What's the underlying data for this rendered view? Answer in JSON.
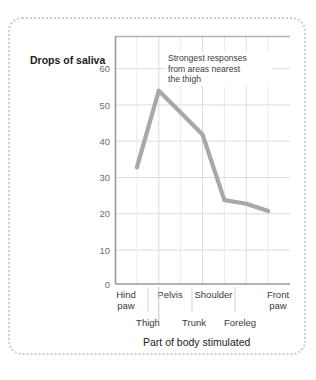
{
  "chart_data": {
    "type": "line",
    "title": "",
    "subtitle": "",
    "ylabel": "Drops of saliva",
    "xlabel": "Part of body stimulated",
    "categories": [
      "Hind paw",
      "Thigh",
      "Pelvis",
      "Trunk",
      "Shoulder",
      "Foreleg",
      "Front paw"
    ],
    "categories_upper": [
      "Hind\npaw",
      "Pelvis",
      "Shoulder",
      "Front\npaw"
    ],
    "categories_lower": [
      "Thigh",
      "Trunk",
      "Foreleg"
    ],
    "values": [
      32,
      53,
      47,
      41,
      23,
      22,
      20
    ],
    "ylim": [
      0,
      68
    ],
    "ytick_labels": [
      "60",
      "50",
      "40",
      "30",
      "20",
      "10",
      "0"
    ],
    "ytick_values": [
      60,
      50,
      40,
      30,
      20,
      10,
      0
    ],
    "grid": true,
    "legend": "none",
    "annotations": [
      {
        "line1": "Strongest responses",
        "line2": "from areas nearest",
        "line3": "the thigh"
      }
    ],
    "series": [
      {
        "name": "Drops of saliva",
        "color": "#a8a8a8",
        "values": [
          32,
          53,
          47,
          41,
          23,
          22,
          20
        ]
      }
    ],
    "colors": {
      "line": "#a8a8a8",
      "gridline": "#ebebeb",
      "gridline_major": "#dcdcdc",
      "axis": "#9a9a9a",
      "text": "#3a3a3a",
      "tick_text": "#6e6e6e",
      "frame_border": "#cfcfcf",
      "background": "#ffffff"
    }
  },
  "xtick_rows": {
    "upper": [
      {
        "l1": "Hind",
        "l2": "paw"
      },
      {
        "l1": "Pelvis",
        "l2": ""
      },
      {
        "l1": "Shoulder",
        "l2": ""
      },
      {
        "l1": "Front",
        "l2": "paw"
      }
    ],
    "lower": [
      "Thigh",
      "Trunk",
      "Foreleg"
    ]
  }
}
